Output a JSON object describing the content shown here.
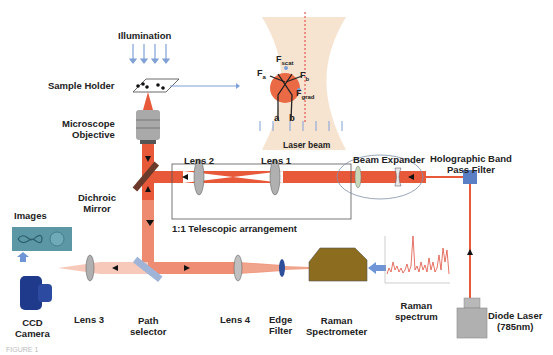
{
  "labels": {
    "illumination": "Illumination",
    "sample_holder": "Sample Holder",
    "microscope_objective_1": "Microscope",
    "microscope_objective_2": "Objective",
    "dichroic_mirror_1": "Dichroic",
    "dichroic_mirror_2": "Mirror",
    "images": "Images",
    "ccd_camera_1": "CCD",
    "ccd_camera_2": "Camera",
    "lens3": "Lens 3",
    "path_selector_1": "Path",
    "path_selector_2": "selector",
    "lens4": "Lens 4",
    "edge_filter_1": "Edge",
    "edge_filter_2": "Filter",
    "raman_spectrometer_1": "Raman",
    "raman_spectrometer_2": "Spectrometer",
    "raman_spectrum_1": "Raman",
    "raman_spectrum_2": "spectrum",
    "diode_laser_1": "Diode Laser",
    "diode_laser_2": "(785nm)",
    "lens2": "Lens 2",
    "lens1": "Lens 1",
    "telescopic": "1:1 Telescopic arrangement",
    "beam_expander": "Beam Expander",
    "holographic_1": "Holographic  Band",
    "holographic_2": "Pass Filter",
    "laser_beam": "Laser beam",
    "f_scat": "F",
    "f_scat_sub": "scat",
    "f_a": "F",
    "f_a_sub": "a",
    "f_b": "F",
    "f_b_sub": "b",
    "f_grad": "F",
    "f_grad_sub": "grad",
    "ray_a": "a",
    "ray_b": "b",
    "figure_caption": "FIGURE 1"
  },
  "colors": {
    "laser": "#e8593a",
    "laser_light": "#f2b3a0",
    "beam_bg": "#f6e4d0",
    "spectrometer": "#8c6d1f",
    "camera": "#1f3a8a",
    "filter_blue": "#5b7fc4",
    "mirror": "#6b3a2a",
    "arrow_blue": "#6f95d6"
  }
}
